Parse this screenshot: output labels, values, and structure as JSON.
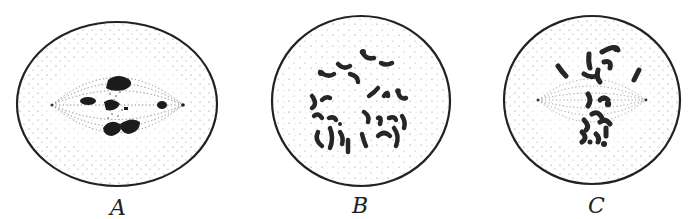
{
  "figure": {
    "panels": [
      {
        "label": "A",
        "cx": 117,
        "cy": 104,
        "rx": 100,
        "ry": 82,
        "type": "spindle-metaphase-side",
        "spindle": {
          "x1": 52,
          "x2": 183,
          "y": 105
        }
      },
      {
        "label": "B",
        "cx": 361,
        "cy": 101,
        "rx": 89,
        "ry": 85,
        "type": "polar-view-chromosomes"
      },
      {
        "label": "C",
        "cx": 592,
        "cy": 100,
        "rx": 88,
        "ry": 84,
        "type": "spindle-with-chromosomes",
        "spindle": {
          "x1": 538,
          "x2": 646,
          "y": 100
        }
      }
    ],
    "colors": {
      "outline": "#222222",
      "stipple": "#6a6a6a",
      "chromosome": "#1c1c1c",
      "background": "#ffffff"
    }
  }
}
